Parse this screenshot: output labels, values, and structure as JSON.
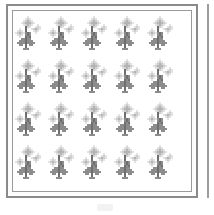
{
  "scene": {
    "kind": "pixel-art-sprite-grid",
    "background_color": "#ffffff"
  },
  "frame": {
    "name": "sprite-sheet-frame",
    "outer_border_color": "#8a8a8a",
    "inner_border_color": "#9a9a9a",
    "fill_color": "#ffffff"
  },
  "right_edge_rule": {
    "color": "#9e9e9e"
  },
  "bottom_smudge": {
    "color": "#f2f2f2"
  },
  "grid": {
    "columns": 5,
    "rows": 4,
    "total_sprites": 20
  },
  "sprite": {
    "name": "plant-sprite",
    "description": "grayscale pixel-art plant with bud top and cross-shaped leaves",
    "palette": {
      "bud_light": "#e3e3e3",
      "bud_mid": "#cfcfcf",
      "bud_dark": "#b4b4b4",
      "stem_dark": "#6f6f6f",
      "body_mid": "#8c8c8c",
      "body_light": "#a8a8a8",
      "shadow": "#d8d8d8"
    }
  },
  "cells": [
    {
      "label": "r1c1"
    },
    {
      "label": "r1c2"
    },
    {
      "label": "r1c3"
    },
    {
      "label": "r1c4"
    },
    {
      "label": "r1c5"
    },
    {
      "label": "r2c1"
    },
    {
      "label": "r2c2"
    },
    {
      "label": "r2c3"
    },
    {
      "label": "r2c4"
    },
    {
      "label": "r2c5"
    },
    {
      "label": "r3c1"
    },
    {
      "label": "r3c2"
    },
    {
      "label": "r3c3"
    },
    {
      "label": "r3c4"
    },
    {
      "label": "r3c5"
    },
    {
      "label": "r4c1"
    },
    {
      "label": "r4c2"
    },
    {
      "label": "r4c3"
    },
    {
      "label": "r4c4"
    },
    {
      "label": "r4c5"
    }
  ]
}
